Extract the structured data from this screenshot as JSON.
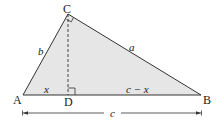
{
  "diagram": {
    "type": "right-triangle-with-altitude",
    "vertices": {
      "A": "A",
      "B": "B",
      "C": "C",
      "D": "D"
    },
    "side_labels": {
      "AC": "b",
      "CB": "a",
      "AD": "x",
      "DB": "c − x",
      "AB": "c"
    },
    "colors": {
      "fill": "#e6e6e6",
      "stroke": "#333333"
    },
    "right_angles": [
      "C",
      "D"
    ],
    "altitude": "CD (dashed)"
  }
}
